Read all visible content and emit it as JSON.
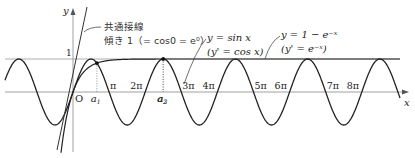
{
  "chart_data": {
    "type": "line",
    "title": "",
    "xlabel": "x",
    "ylabel": "y",
    "origin_label": "O",
    "y_tick_labels": [
      "1"
    ],
    "x_tick_labels": [
      "π",
      "2π",
      "3π",
      "4π",
      "5π",
      "6π",
      "7π",
      "8π"
    ],
    "intersection_labels": [
      "a1",
      "a2",
      "a3",
      "a4",
      "a5",
      "a6",
      "a7",
      "a8"
    ],
    "series": [
      {
        "name": "y = sin x",
        "derivative": "(y' = cos x)"
      },
      {
        "name": "y = 1 − e^(−x)",
        "derivative": "(y' = e^(−x))"
      },
      {
        "name": "共通接線",
        "note": "傾き 1 (= cos0 = e^0)"
      }
    ],
    "asymptote": "y = 1"
  },
  "labels": {
    "y_axis": "y",
    "x_axis": "x",
    "origin": "O",
    "one": "1",
    "tangent_line_1": "共通接線",
    "tangent_line_2": "傾き 1（= cos0 = e⁰）",
    "sin_label_1": "y = sin x",
    "sin_label_2": "(y' = cos x)",
    "exp_label_1": "y = 1 − e⁻ˣ",
    "exp_label_2": "(y' = e⁻ˣ)",
    "pi_ticks": [
      "π",
      "2π",
      "3π",
      "4π",
      "5π",
      "6π",
      "7π",
      "8π"
    ],
    "a_subs": [
      "1",
      "2",
      "3",
      "4",
      "5",
      "6",
      "7",
      "8"
    ]
  }
}
